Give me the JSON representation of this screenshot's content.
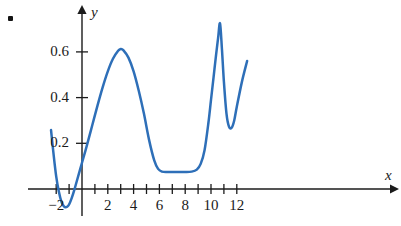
{
  "figure": {
    "bullet_marker": "list-bullet",
    "background_color": "#ffffff",
    "curve_color": "#2e6fb8",
    "axis_color": "#1b1b1b"
  },
  "chart_data": {
    "type": "line",
    "title": "",
    "subtitle": "",
    "xlabel": "x",
    "ylabel": "y",
    "xlim": [
      -2.6,
      12.9
    ],
    "ylim": [
      -0.12,
      0.79
    ],
    "grid": false,
    "legend": null,
    "xticks": [
      -2,
      -1,
      0,
      1,
      2,
      3,
      4,
      5,
      6,
      7,
      8,
      9,
      10,
      11,
      12
    ],
    "xtick_labels": [
      "−2",
      "",
      "",
      "",
      "2",
      "",
      "4",
      "",
      "6",
      "",
      "8",
      "",
      "10",
      "",
      "12"
    ],
    "yticks": [
      0.2,
      0.4,
      0.6
    ],
    "ytick_labels": [
      "0.2",
      "0.4",
      "0.6"
    ],
    "series": [
      {
        "name": "curve",
        "color": "#2e6fb8",
        "x": [
          -2.4,
          -2.2,
          -2.0,
          -1.8,
          -1.6,
          -1.45,
          -1.3,
          -1.15,
          -1.0,
          -0.8,
          -0.6,
          -0.4,
          -0.2,
          0.0,
          0.4,
          0.8,
          1.2,
          1.6,
          2.0,
          2.4,
          2.8,
          3.0,
          3.2,
          3.6,
          4.0,
          4.4,
          4.8,
          5.2,
          5.6,
          5.9,
          6.2,
          6.6,
          7.0,
          7.5,
          8.0,
          8.5,
          8.9,
          9.2,
          9.5,
          9.8,
          10.0,
          10.2,
          10.4,
          10.55,
          10.7,
          10.85,
          11.0,
          11.2,
          11.4,
          11.6,
          11.8,
          12.0,
          12.4,
          12.8
        ],
        "y": [
          0.258,
          0.15,
          0.055,
          -0.01,
          -0.055,
          -0.072,
          -0.08,
          -0.078,
          -0.068,
          -0.04,
          -0.005,
          0.035,
          0.075,
          0.115,
          0.195,
          0.28,
          0.365,
          0.445,
          0.515,
          0.57,
          0.605,
          0.613,
          0.608,
          0.575,
          0.515,
          0.43,
          0.33,
          0.215,
          0.125,
          0.088,
          0.076,
          0.074,
          0.074,
          0.074,
          0.074,
          0.076,
          0.085,
          0.11,
          0.17,
          0.29,
          0.39,
          0.49,
          0.59,
          0.66,
          0.725,
          0.61,
          0.47,
          0.33,
          0.272,
          0.268,
          0.3,
          0.36,
          0.47,
          0.56
        ]
      }
    ],
    "features": {
      "left_local_min": {
        "x": -1.3,
        "y": -0.08
      },
      "main_peak": {
        "x": 3.0,
        "y": 0.61
      },
      "flat_plateau": {
        "x_start": 6.2,
        "x_end": 9.0,
        "y": 0.074
      },
      "spike_peak": {
        "x": 10.7,
        "y": 0.73
      },
      "right_local_min": {
        "x": 11.5,
        "y": 0.27
      },
      "right_end": {
        "x": 12.8,
        "y": 0.56
      }
    }
  }
}
